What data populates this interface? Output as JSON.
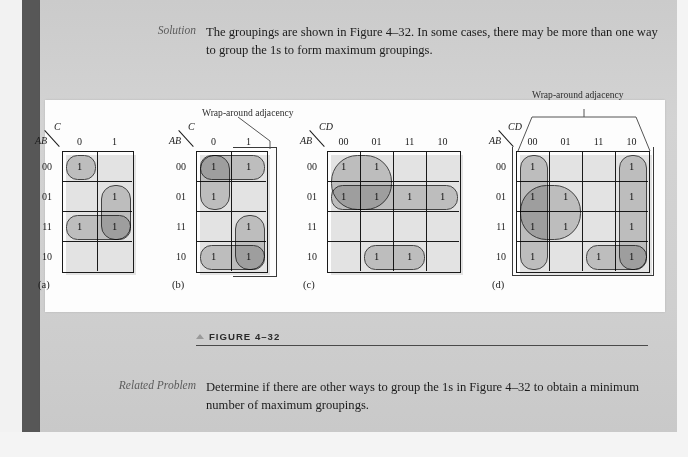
{
  "page": {
    "background_color": "#d0d0d0",
    "panel_color": "#fdfdfd",
    "group_fill": "#969696",
    "ink_color": "#1a1a1a"
  },
  "solution": {
    "label": "Solution",
    "text": "The groupings are shown in Figure 4–32. In some cases, there may be more than one way to group the 1s to form maximum groupings."
  },
  "figure_caption": {
    "marker": "▲",
    "text": "FIGURE 4–32"
  },
  "related_problem": {
    "label": "Related Problem",
    "text": "Determine if there are other ways to group the 1s in Figure 4–32 to obtain a minimum number of maximum groupings."
  },
  "wrap_label": "Wrap-around adjacency",
  "cell_one": "1",
  "maps": [
    {
      "id": "a",
      "sublabel": "(a)",
      "row_var": "AB",
      "col_var": "C",
      "col_headers": [
        "0",
        "1"
      ],
      "row_headers": [
        "00",
        "01",
        "11",
        "10"
      ],
      "ones": [
        [
          0,
          0
        ],
        [
          1,
          1
        ],
        [
          2,
          0
        ],
        [
          2,
          1
        ]
      ],
      "groups": [
        {
          "name": "single-00-0",
          "r0": 0,
          "c0": 0,
          "r1": 0,
          "c1": 0
        },
        {
          "name": "pair-col1-rows01-11",
          "r0": 1,
          "c0": 1,
          "r1": 2,
          "c1": 1
        },
        {
          "name": "pair-row11-cols0-1",
          "r0": 2,
          "c0": 0,
          "r1": 2,
          "c1": 1
        }
      ],
      "wrap": false
    },
    {
      "id": "b",
      "sublabel": "(b)",
      "row_var": "AB",
      "col_var": "C",
      "col_headers": [
        "0",
        "1"
      ],
      "row_headers": [
        "00",
        "01",
        "11",
        "10"
      ],
      "ones": [
        [
          0,
          0
        ],
        [
          0,
          1
        ],
        [
          1,
          0
        ],
        [
          2,
          1
        ],
        [
          3,
          0
        ],
        [
          3,
          1
        ]
      ],
      "groups": [
        {
          "name": "pair-row00-cols0-1",
          "r0": 0,
          "c0": 0,
          "r1": 0,
          "c1": 1
        },
        {
          "name": "pair-col0-rows00-01",
          "r0": 0,
          "c0": 0,
          "r1": 1,
          "c1": 0
        },
        {
          "name": "pair-col1-rows11-10",
          "r0": 2,
          "c0": 1,
          "r1": 3,
          "c1": 1
        },
        {
          "name": "pair-row10-cols0-1",
          "r0": 3,
          "c0": 0,
          "r1": 3,
          "c1": 1
        }
      ],
      "wrap": true,
      "wrap_note": "vertical wrap between top row 00 and bottom row 10 in column 1"
    },
    {
      "id": "c",
      "sublabel": "(c)",
      "row_var": "AB",
      "col_var": "CD",
      "col_headers": [
        "00",
        "01",
        "11",
        "10"
      ],
      "row_headers": [
        "00",
        "01",
        "11",
        "10"
      ],
      "ones": [
        [
          0,
          0
        ],
        [
          0,
          1
        ],
        [
          1,
          0
        ],
        [
          1,
          1
        ],
        [
          1,
          2
        ],
        [
          1,
          3
        ],
        [
          3,
          1
        ],
        [
          3,
          2
        ]
      ],
      "groups": [
        {
          "name": "quad-rows00-01-cols00-01",
          "r0": 0,
          "c0": 0,
          "r1": 1,
          "c1": 1
        },
        {
          "name": "quad-row01-all-cols",
          "r0": 1,
          "c0": 0,
          "r1": 1,
          "c1": 3
        },
        {
          "name": "pair-row10-cols01-11",
          "r0": 3,
          "c0": 1,
          "r1": 3,
          "c1": 2
        }
      ],
      "wrap": false
    },
    {
      "id": "d",
      "sublabel": "(d)",
      "row_var": "AB",
      "col_var": "CD",
      "col_headers": [
        "00",
        "01",
        "11",
        "10"
      ],
      "row_headers": [
        "00",
        "01",
        "11",
        "10"
      ],
      "ones": [
        [
          0,
          0
        ],
        [
          0,
          3
        ],
        [
          1,
          0
        ],
        [
          1,
          1
        ],
        [
          1,
          3
        ],
        [
          2,
          0
        ],
        [
          2,
          1
        ],
        [
          2,
          3
        ],
        [
          3,
          0
        ],
        [
          3,
          2
        ],
        [
          3,
          3
        ]
      ],
      "groups": [
        {
          "name": "quad-col00-all-rows",
          "r0": 0,
          "c0": 0,
          "r1": 3,
          "c1": 0
        },
        {
          "name": "quad-col10-all-rows",
          "r0": 0,
          "c0": 3,
          "r1": 3,
          "c1": 3
        },
        {
          "name": "quad-rows01-11-cols00-01",
          "r0": 1,
          "c0": 0,
          "r1": 2,
          "c1": 1
        },
        {
          "name": "pair-row10-cols11-10",
          "r0": 3,
          "c0": 2,
          "r1": 3,
          "c1": 3
        }
      ],
      "wrap": true,
      "wrap_note": "horizontal wrap between column 00 and column 10"
    }
  ]
}
